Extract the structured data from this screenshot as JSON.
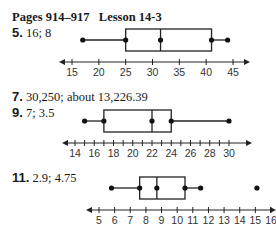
{
  "header": {
    "pages": "Pages 914–917",
    "lesson": "Lesson 14-3"
  },
  "items": [
    {
      "number": "5.",
      "answer": "16; 8"
    },
    {
      "number": "7.",
      "answer": "30,250; about 13,226.39"
    },
    {
      "number": "9.",
      "answer": "7; 3.5"
    },
    {
      "number": "11.",
      "answer": "2.9; 4.75"
    }
  ],
  "chart_data": [
    {
      "type": "boxplot",
      "title": "Exercise 5",
      "axis": {
        "min": 15,
        "max": 45,
        "tick_step": 5,
        "tick_labels": [
          "15",
          "20",
          "25",
          "30",
          "35",
          "40",
          "45"
        ]
      },
      "box": {
        "min": 17,
        "q1": 25,
        "median": 31.5,
        "q3": 41,
        "max": 44
      },
      "outliers": []
    },
    {
      "type": "boxplot",
      "title": "Exercise 9",
      "axis": {
        "min": 14,
        "max": 30,
        "tick_step": 1,
        "tick_labels": [
          "14",
          "16",
          "18",
          "20",
          "22",
          "24",
          "26",
          "28",
          "30"
        ]
      },
      "box": {
        "min": 15,
        "q1": 17,
        "median": 22,
        "q3": 24,
        "max": 30
      },
      "outliers": []
    },
    {
      "type": "boxplot",
      "title": "Exercise 11",
      "axis": {
        "min": 5,
        "max": 16,
        "tick_step": 1,
        "tick_labels": [
          "5",
          "6",
          "7",
          "8",
          "9",
          "10",
          "11",
          "12",
          "13",
          "14",
          "15",
          "16"
        ]
      },
      "box": {
        "min": 5.8,
        "q1": 7.6,
        "median": 8.7,
        "q3": 10.5,
        "max": 11.5
      },
      "outliers": [
        15.1
      ]
    }
  ]
}
